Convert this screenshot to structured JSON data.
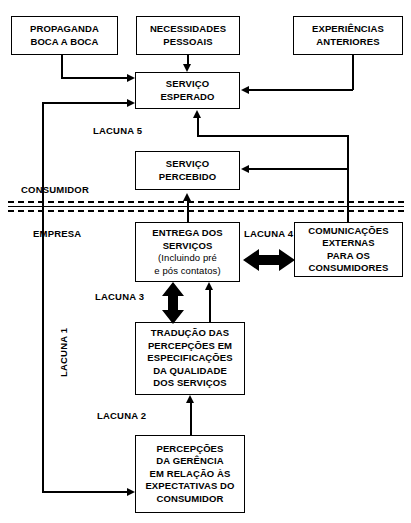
{
  "diagram": {
    "accent_color": "#000000",
    "background_color": "#ffffff"
  },
  "boxes": {
    "propaganda": "PROPAGANDA\nBOCA A BOCA",
    "necessidades": "NECESSIDADES\nPESSOAIS",
    "experiencias": "EXPERIÊNCIAS\nANTERIORES",
    "servico_esperado": "SERVIÇO\nESPERADO",
    "servico_percebido": "SERVIÇO\nPERCEBIDO",
    "entrega_servicos_main": "ENTREGA DOS\nSERVIÇOS",
    "entrega_servicos_sub": "(Incluindo pré\ne pós contatos)",
    "comunicacoes_externas": "COMUNICAÇÕES\nEXTERNAS\nPARA OS\nCONSUMIDORES",
    "traducao": "TRADUÇÃO DAS\nPERCEPÇÕES EM\nESPECIFICAÇÕES\nDA QUALIDADE\nDOS SERVIÇOS",
    "percepcoes_gerencia": "PERCEPÇÕES\nDA GERÊNCIA\nEM RELAÇÃO ÀS\nEXPECTATIVAS DO\nCONSUMIDOR"
  },
  "labels": {
    "lacuna5": "LACUNA 5",
    "lacuna4": "LACUNA 4",
    "lacuna3": "LACUNA 3",
    "lacuna2": "LACUNA 2",
    "lacuna1": "LACUNA 1",
    "consumidor": "CONSUMIDOR",
    "empresa": "EMPRESA"
  }
}
